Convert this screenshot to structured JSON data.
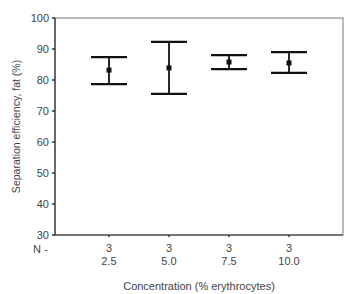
{
  "chart_data": {
    "type": "errorbar",
    "title": "",
    "xlabel": "Concentration (% erythrocytes)",
    "ylabel": "Separation efficiency, fat (%)",
    "ylim": [
      30,
      100
    ],
    "yticks": [
      30,
      40,
      50,
      60,
      70,
      80,
      90,
      100
    ],
    "n_label": "N -",
    "categories": [
      "2.5",
      "5.0",
      "7.5",
      "10.0"
    ],
    "n": [
      3,
      3,
      3,
      3
    ],
    "mean": [
      83.2,
      83.9,
      85.8,
      85.5
    ],
    "upper": [
      87.4,
      92.3,
      88.0,
      89.0
    ],
    "lower": [
      78.7,
      75.5,
      83.5,
      82.3
    ],
    "grid": false,
    "legend": null
  }
}
